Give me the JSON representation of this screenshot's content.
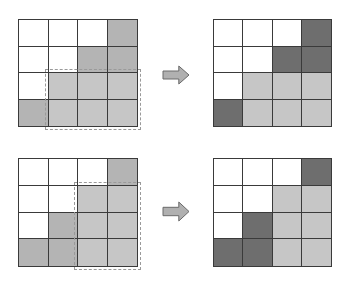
{
  "colors": {
    "white": "#ffffff",
    "medium": "#b4b4b4",
    "light": "#c6c6c6",
    "dark": "#6e6e6e",
    "grid_line": "#3a3a3a",
    "dashed_outline": "#9a9a9a",
    "arrow_fill": "#b0b0b0",
    "arrow_stroke": "#6a6a6a"
  },
  "panels": [
    {
      "name": "top-before",
      "x": 18,
      "y": 19,
      "w": 120,
      "h": 108,
      "cells": [
        [
          "white",
          "white",
          "white",
          "medium"
        ],
        [
          "white",
          "white",
          "medium",
          "medium"
        ],
        [
          "white",
          "light",
          "light",
          "light"
        ],
        [
          "medium",
          "light",
          "light",
          "light"
        ]
      ],
      "selection": {
        "x": 45,
        "y": 69,
        "w": 96,
        "h": 61
      }
    },
    {
      "name": "top-after",
      "x": 213,
      "y": 19,
      "w": 119,
      "h": 108,
      "cells": [
        [
          "white",
          "white",
          "white",
          "dark"
        ],
        [
          "white",
          "white",
          "dark",
          "dark"
        ],
        [
          "white",
          "light",
          "light",
          "light"
        ],
        [
          "dark",
          "light",
          "light",
          "light"
        ]
      ]
    },
    {
      "name": "bottom-before",
      "x": 18,
      "y": 158,
      "w": 120,
      "h": 109,
      "cells": [
        [
          "white",
          "white",
          "white",
          "medium"
        ],
        [
          "white",
          "white",
          "light",
          "light"
        ],
        [
          "white",
          "medium",
          "light",
          "light"
        ],
        [
          "medium",
          "medium",
          "light",
          "light"
        ]
      ],
      "selection": {
        "x": 74,
        "y": 182,
        "w": 67,
        "h": 88
      }
    },
    {
      "name": "bottom-after",
      "x": 213,
      "y": 158,
      "w": 119,
      "h": 109,
      "cells": [
        [
          "white",
          "white",
          "white",
          "dark"
        ],
        [
          "white",
          "white",
          "light",
          "light"
        ],
        [
          "white",
          "dark",
          "light",
          "light"
        ],
        [
          "dark",
          "dark",
          "light",
          "light"
        ]
      ]
    }
  ],
  "arrows": [
    {
      "name": "top-arrow",
      "icon": "right-arrow-icon",
      "x": 162,
      "y": 65,
      "w": 28,
      "h": 20
    },
    {
      "name": "bottom-arrow",
      "icon": "right-arrow-icon",
      "x": 162,
      "y": 201,
      "w": 28,
      "h": 21
    }
  ]
}
